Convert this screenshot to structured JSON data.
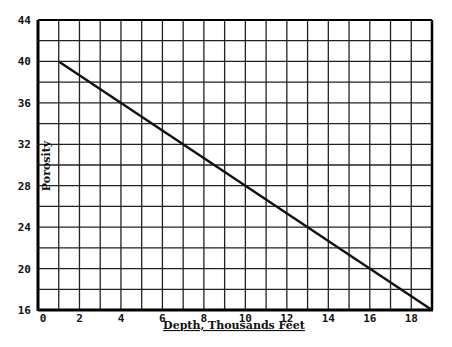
{
  "chart_data": {
    "type": "line",
    "title": "",
    "xlabel": "Depth, Thousands Feet",
    "ylabel": "Porosity",
    "xlim": [
      0,
      19
    ],
    "ylim": [
      16,
      44
    ],
    "x_ticks": [
      0,
      2,
      4,
      6,
      8,
      10,
      12,
      14,
      16,
      18
    ],
    "y_ticks": [
      16,
      20,
      24,
      28,
      32,
      36,
      40,
      44
    ],
    "grid": true,
    "x_grid_step": 1,
    "y_grid_step": 2,
    "legend": null,
    "series": [
      {
        "name": "Porosity vs Depth",
        "x": [
          1,
          19
        ],
        "y": [
          40,
          16
        ],
        "color": "#111111"
      }
    ]
  },
  "colors": {
    "background": "#ffffff",
    "grid": "#222222",
    "line": "#111111"
  }
}
